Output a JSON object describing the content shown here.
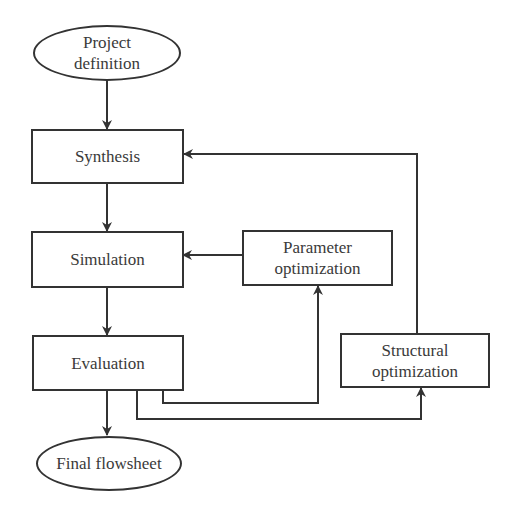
{
  "diagram": {
    "type": "flowchart",
    "nodes": {
      "project_definition": {
        "label_line1": "Project",
        "label_line2": "definition",
        "shape": "ellipse"
      },
      "synthesis": {
        "label": "Synthesis",
        "shape": "rectangle"
      },
      "simulation": {
        "label": "Simulation",
        "shape": "rectangle"
      },
      "evaluation": {
        "label": "Evaluation",
        "shape": "rectangle"
      },
      "parameter_optimization": {
        "label_line1": "Parameter",
        "label_line2": "optimization",
        "shape": "rectangle"
      },
      "structural_optimization": {
        "label_line1": "Structural",
        "label_line2": "optimization",
        "shape": "rectangle"
      },
      "final_flowsheet": {
        "label": "Final flowsheet",
        "shape": "ellipse"
      }
    },
    "edges": [
      {
        "from": "Project definition",
        "to": "Synthesis"
      },
      {
        "from": "Synthesis",
        "to": "Simulation"
      },
      {
        "from": "Simulation",
        "to": "Evaluation"
      },
      {
        "from": "Evaluation",
        "to": "Final flowsheet"
      },
      {
        "from": "Evaluation",
        "to": "Parameter optimization"
      },
      {
        "from": "Parameter optimization",
        "to": "Simulation"
      },
      {
        "from": "Evaluation",
        "to": "Structural optimization"
      },
      {
        "from": "Structural optimization",
        "to": "Synthesis"
      }
    ],
    "colors": {
      "stroke": "#333333",
      "background": "#ffffff",
      "text": "#3a3a3a"
    }
  }
}
